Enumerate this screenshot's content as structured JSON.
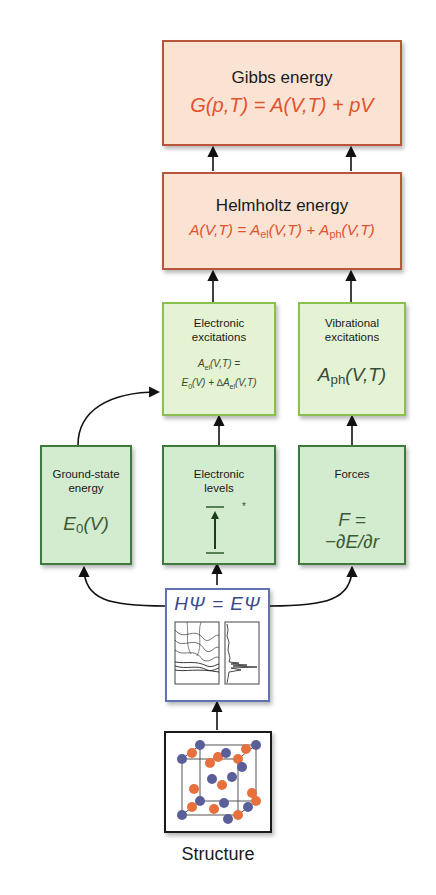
{
  "gibbs": {
    "title": "Gibbs energy",
    "equation_lhs": "G(p,T)",
    "equation_rhs": " = A(V,T) + pV"
  },
  "helmholtz": {
    "title": "Helmholtz energy",
    "eq_a": "A(V,T) = A",
    "eq_el_sub": "el",
    "eq_mid": "(V,T) + A",
    "eq_ph_sub": "ph",
    "eq_end": "(V,T)"
  },
  "electronic_excitations": {
    "title_line1": "Electronic",
    "title_line2": "excitations",
    "eq_line1_a": "A",
    "eq_line1_sub": "el",
    "eq_line1_b": "(V,T) =",
    "eq_line2_a": "E",
    "eq_line2_sub": "0",
    "eq_line2_b": "(V) + ∆A",
    "eq_line2_sub2": "el",
    "eq_line2_c": "(V,T)"
  },
  "vibrational_excitations": {
    "title_line1": "Vibrational",
    "title_line2": "excitations",
    "eq_a": "A",
    "eq_sub": "ph",
    "eq_b": "(V,T)"
  },
  "ground_state": {
    "title_line1": "Ground-state",
    "title_line2": "energy",
    "eq_a": "E",
    "eq_sub": "0",
    "eq_b": "(V)"
  },
  "electronic_levels": {
    "title_line1": "Electronic",
    "title_line2": "levels",
    "excited_marker": "*"
  },
  "forces": {
    "title": "Forces",
    "eq_line1": "F =",
    "eq_line2": "−∂E/∂r"
  },
  "schrodinger": {
    "equation": "HΨ = EΨ"
  },
  "structure": {
    "label": "Structure"
  },
  "colors": {
    "orange_border": "#b8553a",
    "orange_fill": "#fbe3d3",
    "orange_text": "#e2522f",
    "light_green_border": "#8cc04e",
    "light_green_fill": "#e4f3d4",
    "dark_green_border": "#3f7a3d",
    "dark_green_fill": "#d3ebcf",
    "blue_border": "#5f73b3",
    "sphere_orange": "#e8703d",
    "sphere_blue": "#5a5f9a"
  }
}
